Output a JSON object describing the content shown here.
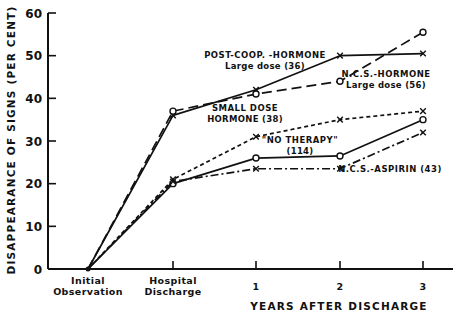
{
  "chart_data": {
    "type": "line",
    "title": "",
    "xlabel": "YEARS AFTER DISCHARGE",
    "ylabel": "DISAPPEARANCE OF SIGNS (PER CENT)",
    "categories": [
      "Initial Observation",
      "Hospital Discharge",
      "1",
      "2",
      "3"
    ],
    "category_lines": [
      [
        "Initial",
        "Observation"
      ],
      [
        "Hospital",
        "Discharge"
      ],
      [
        "1"
      ],
      [
        "2"
      ],
      [
        "3"
      ]
    ],
    "yticks": [
      0,
      10,
      20,
      30,
      40,
      50,
      60
    ],
    "ylim": [
      0,
      60
    ],
    "grid": false,
    "legend_position": "inline labels",
    "series": [
      {
        "name": "POST-COOP.-HORMONE Large dose (36)",
        "label_lines": [
          "POST-COOP. -HORMONE",
          "Large dose (36)"
        ],
        "marker": "x",
        "line_style": "solid",
        "values": [
          0,
          36,
          42,
          50,
          50.5
        ]
      },
      {
        "name": "N.C.S.-HORMONE Large dose (56)",
        "label_lines": [
          "N.C.S.-HORMONE",
          "Large dose (56)"
        ],
        "marker": "o",
        "line_style": "long-dash",
        "values": [
          0,
          37,
          41,
          44,
          55.5
        ]
      },
      {
        "name": "SMALL DOSE HORMONE (38)",
        "label_lines": [
          "SMALL DOSE",
          "HORMONE (38)"
        ],
        "marker": "x",
        "line_style": "short-dash",
        "values": [
          0,
          21,
          31,
          35,
          37
        ]
      },
      {
        "name": "\"NO THERAPY\" (114)",
        "label_lines": [
          "\"NO THERAPY\"",
          "(114)"
        ],
        "marker": "o",
        "line_style": "solid",
        "values": [
          0,
          20,
          26,
          26.5,
          35
        ]
      },
      {
        "name": "N.C.S.-ASPIRIN (43)",
        "label_lines": [
          "N.C.S.-ASPIRIN (43)"
        ],
        "marker": "x",
        "line_style": "dash-dot",
        "values": [
          0,
          20.5,
          23.5,
          23.5,
          32
        ]
      }
    ]
  }
}
